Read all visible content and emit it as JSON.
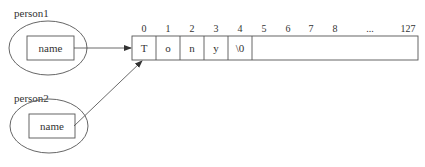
{
  "diagram": {
    "type": "memory-pointer-diagram",
    "objects": [
      {
        "label": "person1",
        "field": "name"
      },
      {
        "label": "person2",
        "field": "name"
      }
    ],
    "array": {
      "indices": [
        "0",
        "1",
        "2",
        "3",
        "4",
        "5",
        "6",
        "7",
        "8",
        "...",
        "127"
      ],
      "cells": [
        "T",
        "o",
        "n",
        "y",
        "\\0",
        ""
      ]
    },
    "colors": {
      "stroke": "#555555",
      "background": "#ffffff"
    }
  }
}
